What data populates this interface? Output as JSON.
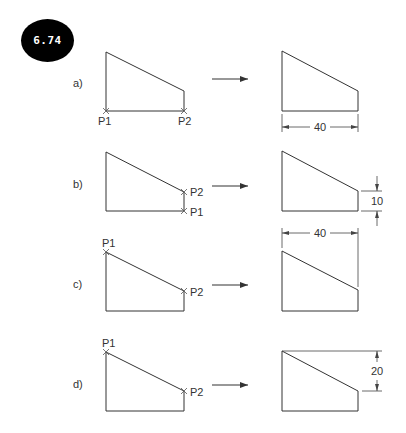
{
  "figure": {
    "number": "6.74",
    "rows": [
      {
        "label": "a)",
        "points": [
          {
            "name": "P1"
          },
          {
            "name": "P2"
          }
        ],
        "result_dimension": {
          "value": "40",
          "orientation": "horizontal"
        }
      },
      {
        "label": "b)",
        "points": [
          {
            "name": "P2"
          },
          {
            "name": "P1"
          }
        ],
        "result_dimension": {
          "value": "10",
          "orientation": "vertical"
        }
      },
      {
        "label": "c)",
        "points": [
          {
            "name": "P1"
          },
          {
            "name": "P2"
          }
        ],
        "result_dimension": {
          "value": "40",
          "orientation": "horizontal"
        }
      },
      {
        "label": "d)",
        "points": [
          {
            "name": "P1"
          },
          {
            "name": "P2"
          }
        ],
        "result_dimension": {
          "value": "20",
          "orientation": "vertical"
        }
      }
    ]
  },
  "colors": {
    "line": "#333333",
    "badge_bg": "#000000",
    "badge_text": "#ffffff",
    "background": "#ffffff"
  }
}
